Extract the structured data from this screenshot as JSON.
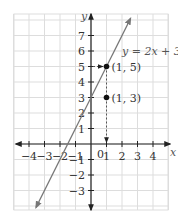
{
  "chart_data": {
    "type": "line",
    "title": "",
    "equation": "y = 2x + 3",
    "xlabel": "x",
    "ylabel": "y",
    "xlim": [
      -4.8,
      5
    ],
    "ylim": [
      -4.2,
      8.4
    ],
    "x_ticks": [
      -4,
      -3,
      -2,
      -1,
      1,
      2,
      3,
      4
    ],
    "y_ticks": [
      -3,
      -2,
      -1,
      1,
      2,
      3,
      4,
      5,
      6,
      7
    ],
    "origin_label": "0",
    "grid": true,
    "line": {
      "slope": 2,
      "intercept": 3,
      "x_range": [
        -3.55,
        2.55
      ]
    },
    "points": [
      {
        "x": 1,
        "y": 5,
        "label": "(1, 5)"
      },
      {
        "x": 1,
        "y": 3,
        "label": "(1, 3)"
      }
    ],
    "annotations": [
      "dashed vertical line from (1,3) to x-axis with arrow",
      "dashed vertical from (1,5) to (1,3)",
      "arrow from y-axis at y=5 pointing to (1,5)"
    ],
    "colors": {
      "line": "#777777",
      "grid": "#dddddd",
      "axis": "#222222",
      "point": "#111111"
    }
  }
}
